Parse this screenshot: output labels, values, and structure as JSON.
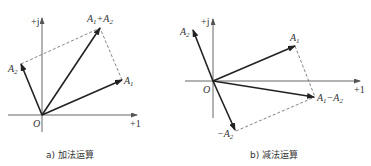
{
  "panels": [
    {
      "id": "a",
      "caption": "a) 加法运算",
      "axes": {
        "imag_label": "+j",
        "real_label": "+1",
        "origin_label": "O"
      },
      "vectors": [
        {
          "name": "A1",
          "label_base": "A",
          "label_sub": "1"
        },
        {
          "name": "A2",
          "label_base": "A",
          "label_sub": "2"
        },
        {
          "name": "A1+A2",
          "label_base": "A",
          "label_sub": "1",
          "label_op": "+",
          "label_base2": "A",
          "label_sub2": "2"
        }
      ]
    },
    {
      "id": "b",
      "caption": "b) 减法运算",
      "axes": {
        "imag_label": "+j",
        "real_label": "+1",
        "origin_label": "O"
      },
      "vectors": [
        {
          "name": "A1",
          "label_base": "A",
          "label_sub": "1"
        },
        {
          "name": "A2",
          "label_base": "A",
          "label_sub": "2"
        },
        {
          "name": "-A2",
          "label_prefix": "−",
          "label_base": "A",
          "label_sub": "2"
        },
        {
          "name": "A1-A2",
          "label_base": "A",
          "label_sub": "1",
          "label_op": "−",
          "label_base2": "A",
          "label_sub2": "2"
        }
      ]
    }
  ],
  "colors": {
    "vector": "#222222",
    "axis": "#555555",
    "dashed": "#666666",
    "text": "#333333"
  }
}
